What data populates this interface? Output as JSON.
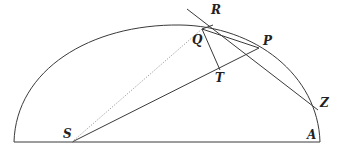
{
  "diagram": {
    "type": "geometric-construction",
    "stroke_color": "#3a3a3a",
    "dotted_color": "#9a9a9a",
    "labels": {
      "R": "R",
      "Q": "Q",
      "P": "P",
      "T": "T",
      "Z": "Z",
      "S": "S",
      "A": "A"
    },
    "points": {
      "S": [
        72,
        142
      ],
      "A": [
        320,
        142
      ],
      "Q": [
        202,
        29
      ],
      "R": [
        212,
        25
      ],
      "P": [
        259,
        48
      ],
      "T": [
        220,
        70
      ],
      "Z": [
        318,
        110
      ]
    },
    "segments": [
      {
        "from": "baseline-left",
        "to": "A",
        "style": "solid"
      },
      {
        "from": "S",
        "to": "P",
        "style": "solid"
      },
      {
        "from": "S",
        "to": "Q",
        "style": "dotted"
      },
      {
        "from": "Q",
        "to": "T",
        "style": "solid"
      },
      {
        "from": "Q",
        "to": "R",
        "style": "solid"
      },
      {
        "from": "Q",
        "to": "P",
        "style": "solid"
      },
      {
        "from": "tangent-start",
        "to": "Z",
        "style": "solid",
        "through": [
          "R",
          "P"
        ]
      }
    ]
  }
}
